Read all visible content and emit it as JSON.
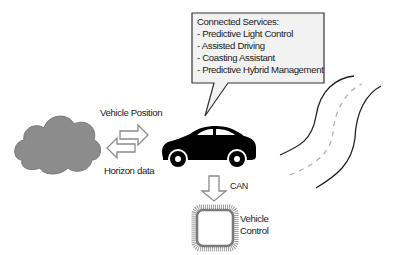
{
  "callout": {
    "title": "Connected Services:",
    "items": [
      "- Predictive Light Control",
      "- Assisted Driving",
      "- Coasting Assistant",
      "- Predictive Hybrid Management"
    ]
  },
  "labels": {
    "vehicle_position": "Vehicle Position",
    "horizon_data": "Horizon data",
    "can": "CAN",
    "vehicle_control_line1": "Vehicle",
    "vehicle_control_line2": "Control"
  },
  "icons": {
    "cloud": "cloud-icon",
    "exchange_arrows": "bidirectional-arrows-icon",
    "car": "car-icon",
    "down_arrow": "down-arrow-icon",
    "chip": "microchip-icon",
    "road": "winding-road-icon"
  },
  "colors": {
    "cloud_fill": "#8c8c8c",
    "callout_fill": "#f2f2f2",
    "callout_border": "#333333",
    "car": "#000000",
    "road_line": "#222222",
    "road_center": "#b0b0b0",
    "chip": "#8a8a8a"
  }
}
